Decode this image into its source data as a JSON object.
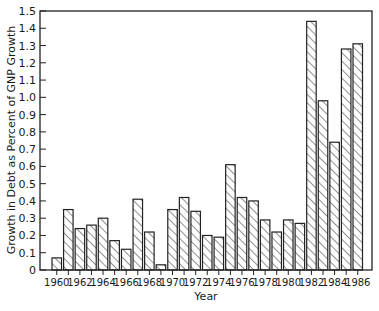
{
  "chart_data": {
    "type": "bar",
    "title": "",
    "xlabel": "Year",
    "ylabel": "Growth in Debt as Percent of GNP Growth",
    "ylim": [
      0,
      1.5
    ],
    "yticks": [
      "0",
      "0.1",
      "0.2",
      "0.3",
      "0.4",
      "0.5",
      "0.6",
      "0.7",
      "0.8",
      "0.9",
      "1.0",
      "1.1",
      "1.2",
      "1.3",
      "1.4",
      "1.5"
    ],
    "xtick_labels": [
      "1960",
      "1962",
      "1964",
      "1966",
      "1968",
      "1970",
      "1972",
      "1974",
      "1976",
      "1978",
      "1980",
      "1982",
      "1984",
      "1986"
    ],
    "categories": [
      1960,
      1961,
      1962,
      1963,
      1964,
      1965,
      1966,
      1967,
      1968,
      1969,
      1970,
      1971,
      1972,
      1973,
      1974,
      1975,
      1976,
      1977,
      1978,
      1979,
      1980,
      1981,
      1982,
      1983,
      1984,
      1985,
      1986
    ],
    "values": [
      0.07,
      0.35,
      0.24,
      0.26,
      0.3,
      0.17,
      0.12,
      0.41,
      0.22,
      0.03,
      0.35,
      0.42,
      0.34,
      0.2,
      0.19,
      0.61,
      0.42,
      0.4,
      0.29,
      0.22,
      0.29,
      0.27,
      1.44,
      0.98,
      0.74,
      1.28,
      1.31
    ],
    "bar_fill": "hatched",
    "grid": false,
    "legend": null
  }
}
